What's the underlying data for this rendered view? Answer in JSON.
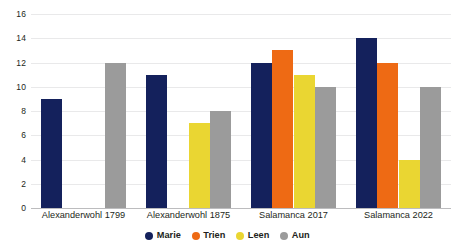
{
  "chart_data": {
    "type": "bar",
    "title": "",
    "xlabel": "",
    "ylabel": "",
    "ylim": [
      0,
      16
    ],
    "yticks": [
      0,
      2,
      4,
      6,
      8,
      10,
      12,
      14,
      16
    ],
    "grid": true,
    "legend_position": "bottom",
    "categories": [
      "Alexanderwohl 1799",
      "Alexanderwohl 1875",
      "Salamanca 2017",
      "Salamanca 2022"
    ],
    "series": [
      {
        "name": "Marie",
        "color": "#14215c",
        "values": [
          9,
          11,
          12,
          14
        ]
      },
      {
        "name": "Trien",
        "color": "#ee6a14",
        "values": [
          null,
          null,
          13,
          12
        ]
      },
      {
        "name": "Leen",
        "color": "#ead632",
        "values": [
          null,
          7,
          11,
          4
        ]
      },
      {
        "name": "Aun",
        "color": "#9b9b9b",
        "values": [
          12,
          8,
          10,
          10
        ]
      }
    ]
  },
  "axis": {
    "ytick_labels": [
      "0",
      "2",
      "4",
      "6",
      "8",
      "10",
      "12",
      "14",
      "16"
    ]
  },
  "legend": {
    "items": [
      {
        "label": "Marie",
        "color": "#14215c",
        "marker": "circle-marker"
      },
      {
        "label": "Trien",
        "color": "#ee6a14",
        "marker": "circle-marker"
      },
      {
        "label": "Leen",
        "color": "#ead632",
        "marker": "circle-marker"
      },
      {
        "label": "Aun",
        "color": "#9b9b9b",
        "marker": "circle-marker"
      }
    ]
  }
}
